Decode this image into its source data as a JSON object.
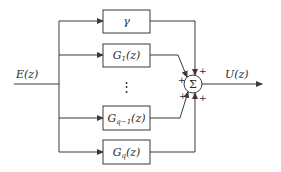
{
  "diagram": {
    "type": "parallel block diagram with summing junction",
    "input": {
      "label": "E(z)"
    },
    "output": {
      "label": "U(z)"
    },
    "blocks": [
      {
        "id": "gamma",
        "label": "γ"
      },
      {
        "id": "g1",
        "label": "G1(z)",
        "base": "G",
        "sub": "1",
        "arg": "(z)"
      },
      {
        "id": "gq_minus_1",
        "label": "Gq−1(z)",
        "base": "G",
        "sub": "q−1",
        "arg": "(z)"
      },
      {
        "id": "gq",
        "label": "Gq(z)",
        "base": "G",
        "sub": "q",
        "arg": "(z)"
      }
    ],
    "ellipsis": "⋮",
    "summing_junction": {
      "symbol": "Σ",
      "signs": [
        "+",
        "+",
        "+",
        "+"
      ]
    },
    "colors": {
      "stroke": "#3a3a3a",
      "background": "#ffffff"
    }
  }
}
